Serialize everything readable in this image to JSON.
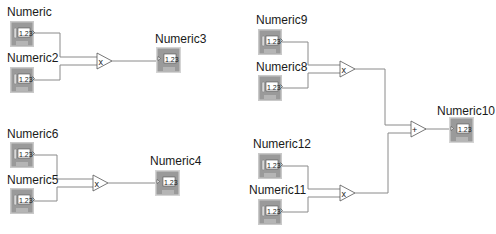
{
  "diagram": {
    "type": "LabVIEW block diagram",
    "controls": [
      {
        "id": "c1",
        "label": "Numeric",
        "kind": "control",
        "value_text": "1.23",
        "repr": "DBL"
      },
      {
        "id": "c2",
        "label": "Numeric2",
        "kind": "control",
        "value_text": "1.23",
        "repr": "DBL"
      },
      {
        "id": "c3",
        "label": "Numeric6",
        "kind": "control",
        "value_text": "1.23",
        "repr": "DBL"
      },
      {
        "id": "c4",
        "label": "Numeric5",
        "kind": "control",
        "value_text": "1.23",
        "repr": "DBL"
      },
      {
        "id": "c5",
        "label": "Numeric9",
        "kind": "control",
        "value_text": "1.23",
        "repr": "DBL"
      },
      {
        "id": "c6",
        "label": "Numeric8",
        "kind": "control",
        "value_text": "1.23",
        "repr": "DBL"
      },
      {
        "id": "c7",
        "label": "Numeric12",
        "kind": "control",
        "value_text": "1.23",
        "repr": "DBL"
      },
      {
        "id": "c8",
        "label": "Numeric11",
        "kind": "control",
        "value_text": "1.23",
        "repr": "DBL"
      }
    ],
    "indicators": [
      {
        "id": "i1",
        "label": "Numeric3",
        "kind": "indicator",
        "value_text": "1.23",
        "repr": "DBL"
      },
      {
        "id": "i2",
        "label": "Numeric4",
        "kind": "indicator",
        "value_text": "1.23",
        "repr": "DBL"
      },
      {
        "id": "i3",
        "label": "Numeric10",
        "kind": "indicator",
        "value_text": "1.23",
        "repr": "DBL"
      }
    ],
    "operators": [
      {
        "id": "m1",
        "symbol": "x",
        "name": "multiply"
      },
      {
        "id": "m2",
        "symbol": "x",
        "name": "multiply"
      },
      {
        "id": "m3",
        "symbol": "x",
        "name": "multiply"
      },
      {
        "id": "m4",
        "symbol": "x",
        "name": "multiply"
      },
      {
        "id": "a1",
        "symbol": "+",
        "name": "add"
      }
    ],
    "connections": [
      [
        "Numeric",
        "multiply-1"
      ],
      [
        "Numeric2",
        "multiply-1"
      ],
      [
        "multiply-1",
        "Numeric3"
      ],
      [
        "Numeric6",
        "multiply-2"
      ],
      [
        "Numeric5",
        "multiply-2"
      ],
      [
        "multiply-2",
        "Numeric4"
      ],
      [
        "Numeric9",
        "multiply-3"
      ],
      [
        "Numeric8",
        "multiply-3"
      ],
      [
        "Numeric12",
        "multiply-4"
      ],
      [
        "Numeric11",
        "multiply-4"
      ],
      [
        "multiply-3",
        "add"
      ],
      [
        "multiply-4",
        "add"
      ],
      [
        "add",
        "Numeric10"
      ]
    ],
    "colors": {
      "wire": "#8a8a8a",
      "terminal_body": "#9e9e9e",
      "terminal_border": "#c8c8c8",
      "background": "#ffffff"
    }
  }
}
